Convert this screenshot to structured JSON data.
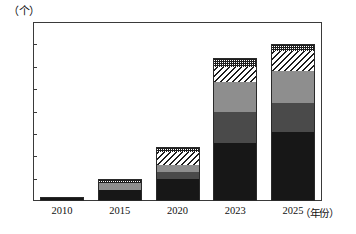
{
  "chart_data": {
    "type": "bar",
    "subtype": "stacked-bar",
    "title": "",
    "unit_label": "（个）",
    "xlabel": "（年份）",
    "ylabel": "",
    "categories": [
      "2010",
      "2015",
      "2020",
      "2023",
      "2025"
    ],
    "ytick_labels": [
      "0",
      "10",
      "20",
      "30",
      "40",
      "50",
      "60",
      "70",
      "80"
    ],
    "yticks": [
      0,
      10,
      20,
      30,
      40,
      50,
      60,
      70,
      80
    ],
    "ylim": [
      0,
      80
    ],
    "grid": false,
    "legend": "none",
    "series": [
      {
        "name": "segment-1",
        "pattern": "solid-black",
        "color": "#171717",
        "values": [
          1.5,
          5,
          10,
          26,
          31
        ]
      },
      {
        "name": "segment-2",
        "pattern": "solid-dark-gray",
        "color": "#4a4a4a",
        "values": [
          0,
          0,
          3,
          14,
          13
        ]
      },
      {
        "name": "segment-3",
        "pattern": "solid-mid-gray",
        "color": "#8e8e8e",
        "values": [
          0,
          3,
          3,
          13,
          14
        ]
      },
      {
        "name": "segment-4",
        "pattern": "diagonal-hatch",
        "color": "#ffffff",
        "values": [
          0,
          0,
          6,
          7,
          9
        ]
      },
      {
        "name": "segment-5",
        "pattern": "checkered",
        "color": "#ffffff",
        "values": [
          0.5,
          2,
          2,
          4,
          3
        ]
      }
    ],
    "totals": [
      2,
      10,
      24,
      64,
      70
    ]
  },
  "axis": {
    "y_unit": "（个）",
    "x_unit": "（年份）"
  }
}
